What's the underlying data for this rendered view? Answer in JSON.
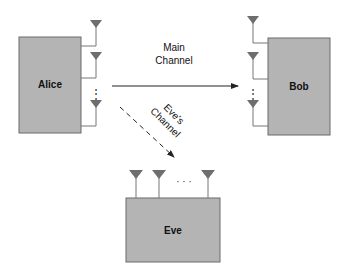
{
  "diagram": {
    "nodes": [
      {
        "id": "alice",
        "label": "Alice",
        "antennas": "multiple (2 shown + ellipsis + 1)"
      },
      {
        "id": "bob",
        "label": "Bob",
        "antennas": "multiple (2 shown + ellipsis + 1)"
      },
      {
        "id": "eve",
        "label": "Eve",
        "antennas": "multiple (2 shown + ellipsis + 1)"
      }
    ],
    "edges": [
      {
        "from": "alice",
        "to": "bob",
        "label_line1": "Main",
        "label_line2": "Channel",
        "style": "solid"
      },
      {
        "from": "alice",
        "to": "eve",
        "label_line1": "Eve's",
        "label_line2": "Channel",
        "style": "dashed"
      }
    ],
    "ellipsis_vertical": "⋮",
    "ellipsis_horizontal": "· · ·"
  },
  "colors": {
    "box_fill": "#b4b4b4",
    "box_stroke": "#6a6a6a",
    "antenna_fill": "#6e6e6e",
    "line": "#777777",
    "arrow": "#222222"
  }
}
